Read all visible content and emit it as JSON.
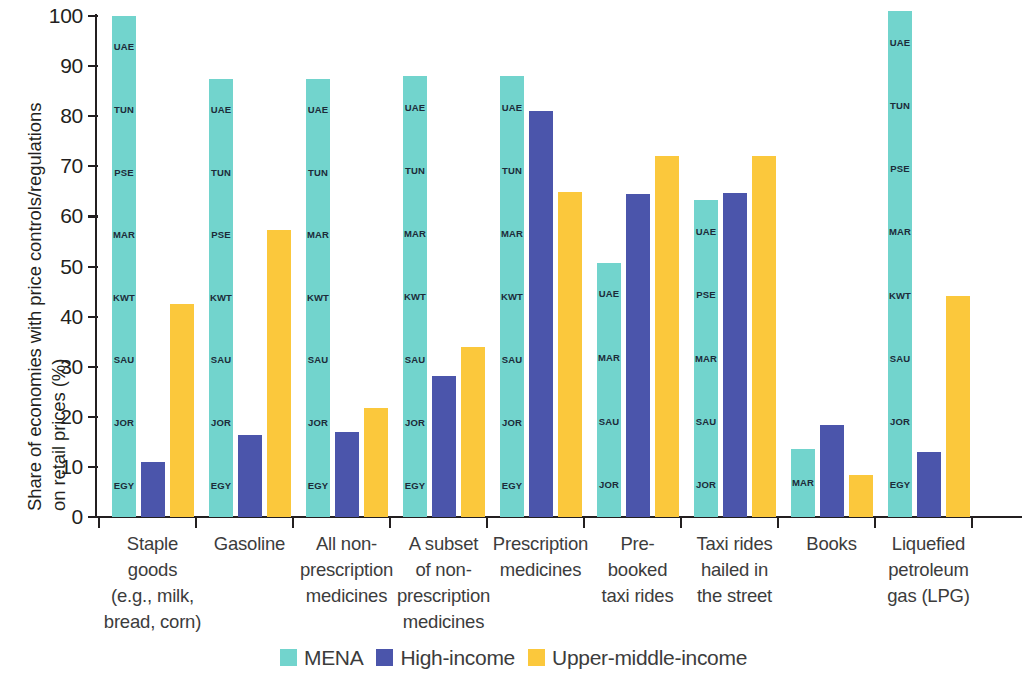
{
  "chart_data": {
    "type": "bar",
    "title": "",
    "xlabel": "",
    "ylabel": "Share of economies  with price controls/regulations on retail prices (%)",
    "ylabel_lines": [
      "Share of economies  with price controls/regulations",
      "on retail prices (%)"
    ],
    "ylim": [
      0,
      100
    ],
    "ytick_labels": [
      "0",
      "10",
      "20",
      "30",
      "40",
      "50",
      "60",
      "70",
      "80",
      "90",
      "100"
    ],
    "ytick_values": [
      0,
      10,
      20,
      30,
      40,
      50,
      60,
      70,
      80,
      90,
      100
    ],
    "grid": false,
    "legend_position": "bottom",
    "categories": [
      "Staple goods (e.g., milk, bread, corn)",
      "Gasoline",
      "All non-prescription medicines",
      "A subset of non-prescription medicines",
      "Prescription medicines",
      "Pre-booked taxi rides",
      "Taxi rides hailed in the street",
      "Books",
      "Liquefied petroleum gas (LPG)"
    ],
    "category_lines": [
      [
        "Staple",
        "goods",
        "(e.g., milk,",
        "bread, corn)"
      ],
      [
        "Gasoline"
      ],
      [
        "All non-",
        "prescription",
        "medicines"
      ],
      [
        "A subset",
        "of non-",
        "prescription",
        "medicines"
      ],
      [
        "Prescription",
        "medicines"
      ],
      [
        "Pre-",
        "booked",
        "taxi rides"
      ],
      [
        "Taxi rides",
        "hailed in",
        "the street"
      ],
      [
        "Books"
      ],
      [
        "Liquefied",
        "petroleum",
        "gas (LPG)"
      ]
    ],
    "series": [
      {
        "name": "MENA",
        "color": "#72d4cd",
        "values": [
          100,
          87.5,
          87.5,
          88,
          88,
          50.8,
          63.2,
          13.5,
          101
        ]
      },
      {
        "name": "High-income",
        "color": "#4b55ab",
        "values": [
          11,
          16.3,
          17,
          28.2,
          81,
          64.5,
          64.7,
          18.4,
          13
        ]
      },
      {
        "name": "Upper-middle-income",
        "color": "#fbc83c",
        "values": [
          42.5,
          57.3,
          21.7,
          33.9,
          64.8,
          72,
          72,
          8.3,
          44.2
        ]
      }
    ],
    "mena_economy_labels": [
      [
        "UAE",
        "TUN",
        "PSE",
        "MAR",
        "KWT",
        "SAU",
        "JOR",
        "EGY"
      ],
      [
        "UAE",
        "TUN",
        "PSE",
        "KWT",
        "SAU",
        "JOR",
        "EGY"
      ],
      [
        "UAE",
        "TUN",
        "MAR",
        "KWT",
        "SAU",
        "JOR",
        "EGY"
      ],
      [
        "UAE",
        "TUN",
        "MAR",
        "KWT",
        "SAU",
        "JOR",
        "EGY"
      ],
      [
        "UAE",
        "TUN",
        "MAR",
        "KWT",
        "SAU",
        "JOR",
        "EGY"
      ],
      [
        "UAE",
        "MAR",
        "SAU",
        "JOR"
      ],
      [
        "UAE",
        "PSE",
        "MAR",
        "SAU",
        "JOR"
      ],
      [
        "MAR"
      ],
      [
        "UAE",
        "TUN",
        "PSE",
        "MAR",
        "KWT",
        "SAU",
        "JOR",
        "EGY"
      ]
    ]
  },
  "legend": {
    "items": [
      {
        "label": "MENA",
        "color": "#72d4cd"
      },
      {
        "label": "High-income",
        "color": "#4b55ab"
      },
      {
        "label": "Upper-middle-income",
        "color": "#fbc83c"
      }
    ]
  }
}
